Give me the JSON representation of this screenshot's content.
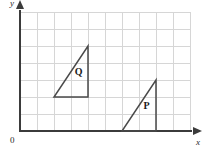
{
  "figure": {
    "type": "coordinate-grid-diagram",
    "axes": {
      "x_label": "x",
      "y_label": "y",
      "origin_label": "0"
    },
    "grid": {
      "columns": 10,
      "rows": 7,
      "cell_size_px": 17,
      "origin_px": {
        "x": 20,
        "y": 131
      },
      "line_color": "#d6d6d6",
      "axis_color": "#3b3b3b",
      "visible": true
    },
    "shapes": [
      {
        "label": "Q",
        "label_grid_position": {
          "x": 3.45,
          "y": 3.45
        },
        "vertices": [
          {
            "x": 2,
            "y": 2
          },
          {
            "x": 4,
            "y": 2
          },
          {
            "x": 4,
            "y": 5
          }
        ],
        "stroke_color": "#4a4a4a"
      },
      {
        "label": "P",
        "label_grid_position": {
          "x": 7.45,
          "y": 1.45
        },
        "vertices": [
          {
            "x": 6,
            "y": 0
          },
          {
            "x": 8,
            "y": 0
          },
          {
            "x": 8,
            "y": 3
          }
        ],
        "stroke_color": "#4a4a4a"
      }
    ]
  }
}
